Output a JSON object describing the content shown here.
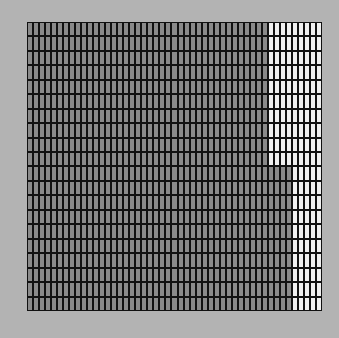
{
  "grid": {
    "columns": 49,
    "rows": 20,
    "colors": {
      "background": "#b3b3b3",
      "line": "#111111",
      "filled": "#8a8a8a",
      "empty": "#f0f0f0"
    },
    "regions": [
      {
        "rows_from": 0,
        "rows_to": 9,
        "empty_from_column": 40
      },
      {
        "rows_from": 10,
        "rows_to": 19,
        "empty_from_column": 44
      }
    ]
  }
}
